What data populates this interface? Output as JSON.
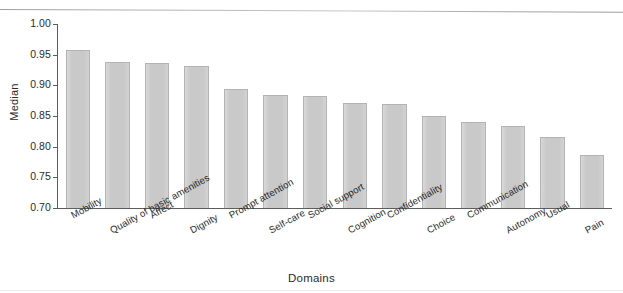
{
  "chart_data": {
    "type": "bar",
    "title": "",
    "xlabel": "Domains",
    "ylabel": "Median",
    "ylim": [
      0.7,
      1.0
    ],
    "yticks": [
      "1.00",
      "0.95",
      "0.90",
      "0.85",
      "0.80",
      "0.75",
      "0.70"
    ],
    "ytick_values": [
      1.0,
      0.95,
      0.9,
      0.85,
      0.8,
      0.75,
      0.7
    ],
    "grid": false,
    "legend": null,
    "bar_color": "#c9c9c9",
    "bar_edge_color": "#b3b3b3",
    "categories": [
      "Mobility",
      "Quality of basic amenities",
      "Affect",
      "Dignity",
      "Prompt attention",
      "Self-care",
      "Social support",
      "Cognition",
      "Confidentiality",
      "Choice",
      "Communication",
      "Autonomy",
      "Usual",
      "Pain"
    ],
    "values": [
      0.957,
      0.938,
      0.936,
      0.931,
      0.894,
      0.885,
      0.882,
      0.872,
      0.869,
      0.85,
      0.841,
      0.834,
      0.816,
      0.787
    ]
  }
}
